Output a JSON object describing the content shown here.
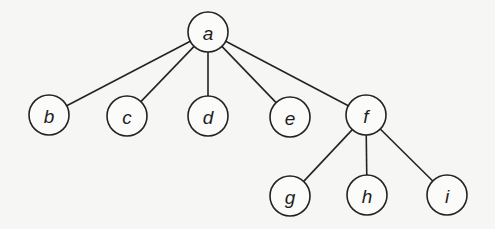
{
  "diagram": {
    "type": "tree",
    "background": "#f6f6f4",
    "stroke_color": "#232323",
    "node_radius": 20,
    "nodes": [
      {
        "id": "a",
        "label": "a",
        "x": 208,
        "y": 32
      },
      {
        "id": "b",
        "label": "b",
        "x": 49,
        "y": 115
      },
      {
        "id": "c",
        "label": "c",
        "x": 127,
        "y": 116
      },
      {
        "id": "d",
        "label": "d",
        "x": 208,
        "y": 116
      },
      {
        "id": "e",
        "label": "e",
        "x": 290,
        "y": 117
      },
      {
        "id": "f",
        "label": "f",
        "x": 366,
        "y": 115
      },
      {
        "id": "g",
        "label": "g",
        "x": 290,
        "y": 196
      },
      {
        "id": "h",
        "label": "h",
        "x": 367,
        "y": 195
      },
      {
        "id": "i",
        "label": "i",
        "x": 447,
        "y": 195
      }
    ],
    "edges": [
      {
        "from": "a",
        "to": "b"
      },
      {
        "from": "a",
        "to": "c"
      },
      {
        "from": "a",
        "to": "d"
      },
      {
        "from": "a",
        "to": "e"
      },
      {
        "from": "a",
        "to": "f"
      },
      {
        "from": "f",
        "to": "g"
      },
      {
        "from": "f",
        "to": "h"
      },
      {
        "from": "f",
        "to": "i"
      }
    ]
  }
}
